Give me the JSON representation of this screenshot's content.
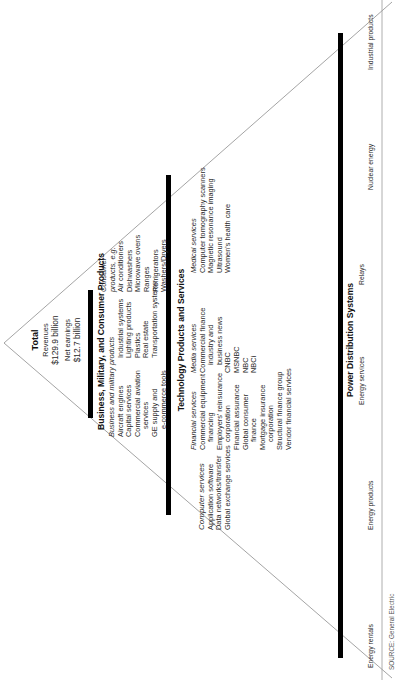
{
  "total": {
    "title": "Total",
    "revenues_label": "Revenues",
    "revenues_value": "$129.9 billion",
    "earnings_label": "Net earnings",
    "earnings_value": "$12.7 billion"
  },
  "segments": [
    {
      "title": "Business, Military, and Consumer Products",
      "columns": [
        {
          "heading": "Business and military products",
          "items": [
            "Aircraft engines",
            "Capital services",
            "Commercial aviation",
            "services",
            "GE supply and",
            "e-commerce tools"
          ]
        },
        {
          "heading": "",
          "items": [
            "Industrial systems",
            "Lighting products",
            "Plastics",
            "Real estate",
            "Transportation systems"
          ]
        },
        {
          "heading": "Consumer products, e.g.",
          "heading_lines": [
            "Consumer",
            "products, e.g."
          ],
          "items": [
            "Air conditioners",
            "Dishwashers",
            "Microwave ovens",
            "Ranges",
            "Refrigerators",
            "Washers/Dryers"
          ]
        }
      ]
    },
    {
      "title": "Technology Products and Services",
      "columns": [
        {
          "heading": "Computer services",
          "items": [
            "Application software",
            "Data networks/transfer",
            "Global exchange services"
          ]
        },
        {
          "heading": "Financial services",
          "items": [
            "Commercial equipment",
            "financing",
            "Employers' reinsurance",
            "corporation",
            "Financial assurance",
            "Global consumer",
            "finance",
            "Mortgage insurance",
            "corporation",
            "Structural finance group",
            "Vendor financial services"
          ]
        },
        {
          "heading": "Media services",
          "items": [
            "Commercial finance",
            "industry and",
            "business news",
            "CNBC",
            "MSNBC",
            "NBC",
            "NBCi"
          ]
        },
        {
          "heading": "Medical services",
          "items": [
            "Computer tomography scanners",
            "Magnetic resonance imaging",
            "Ultrasound",
            "Women's health care"
          ]
        }
      ]
    },
    {
      "title": "Power Distribution Systems",
      "items": [
        "Energy services",
        "Relays"
      ]
    }
  ],
  "base_row": [
    "Energy rentals",
    "Energy products",
    "Nuclear energy",
    "Industrial products"
  ],
  "source_line": "SOURCE: General Electric"
}
